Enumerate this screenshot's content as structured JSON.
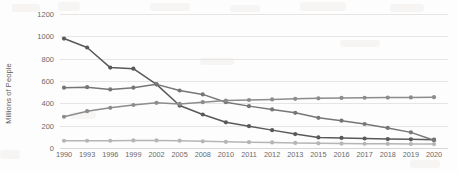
{
  "chart_data": {
    "type": "line",
    "title": "",
    "xlabel": "",
    "ylabel": "Millions of People",
    "ylim": [
      0,
      1200
    ],
    "yticks": [
      0,
      200,
      400,
      600,
      800,
      1000,
      1200
    ],
    "grid": true,
    "legend": "none",
    "categories": [
      "1990",
      "1993",
      "1996",
      "1999",
      "2002",
      "2005",
      "2008",
      "2010",
      "2011",
      "2012",
      "2013",
      "2015",
      "2016",
      "2017",
      "2018",
      "2019",
      "2020"
    ],
    "series": [
      {
        "name": "series-declining-steep",
        "color": "#595959",
        "values": [
          980,
          900,
          720,
          710,
          570,
          380,
          300,
          230,
          195,
          160,
          125,
          95,
          90,
          85,
          80,
          78,
          75
        ]
      },
      {
        "name": "series-flat-then-declining",
        "color": "#767676",
        "values": [
          540,
          545,
          525,
          540,
          570,
          515,
          480,
          410,
          375,
          345,
          315,
          270,
          245,
          215,
          180,
          140,
          70
        ]
      },
      {
        "name": "series-rising-then-flat",
        "color": "#8c8c8c",
        "values": [
          280,
          330,
          360,
          385,
          405,
          395,
          410,
          425,
          430,
          435,
          440,
          445,
          448,
          450,
          452,
          453,
          455
        ]
      },
      {
        "name": "series-low-flat",
        "color": "#b5b5b5",
        "values": [
          65,
          65,
          65,
          68,
          68,
          66,
          60,
          55,
          52,
          50,
          45,
          42,
          40,
          38,
          37,
          36,
          35
        ]
      }
    ]
  }
}
